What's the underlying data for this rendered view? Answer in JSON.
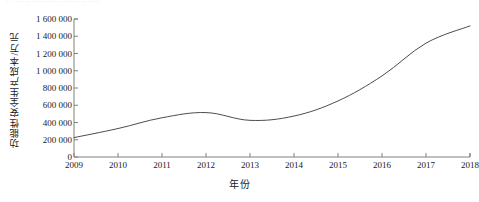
{
  "top_remnant": "· · ··· ·· ······ ····  ·····   ···· ·····",
  "chart_data": {
    "type": "line",
    "title": "",
    "xlabel": "年份",
    "ylabel": "功能性安全生产成本/万元",
    "categories": [
      "2009",
      "2010",
      "2011",
      "2012",
      "2013",
      "2014",
      "2015",
      "2016",
      "2017",
      "2018"
    ],
    "x_tick_labels": [
      "2009",
      "2010",
      "2011",
      "2012",
      "2013",
      "2014",
      "2015",
      "2016",
      "2017",
      "2018"
    ],
    "y_tick_labels": [
      "0",
      "200 000",
      "400 000",
      "600 000",
      "800 000",
      "1 000 000",
      "1 200 000",
      "1 400 000",
      "1 600 000"
    ],
    "y_tick_values": [
      0,
      200000,
      400000,
      600000,
      800000,
      1000000,
      1200000,
      1400000,
      1600000
    ],
    "ylim": [
      0,
      1600000
    ],
    "grid": false,
    "legend": false,
    "legend_position": "none",
    "series": [
      {
        "name": "功能性安全生产成本",
        "color": "#4d4d4d",
        "line_width": 1,
        "marker": "none",
        "values": [
          225000,
          330000,
          455000,
          515000,
          425000,
          475000,
          650000,
          940000,
          1320000,
          1520000
        ]
      }
    ]
  }
}
